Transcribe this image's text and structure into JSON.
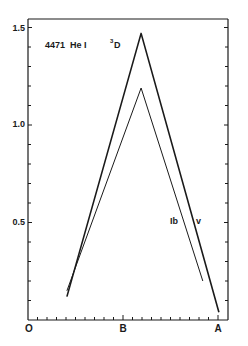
{
  "chart_data": {
    "type": "line",
    "title": "4471 He I",
    "subtitle": "3D",
    "xlabel": "",
    "ylabel": "",
    "x_tick_labels": [
      {
        "label": "O",
        "value": 0
      },
      {
        "label": "B",
        "value": 1
      },
      {
        "label": "A",
        "value": 2
      }
    ],
    "y_tick_labels": [
      "0.5",
      "1.0",
      "1.5"
    ],
    "ylim": [
      0,
      1.55
    ],
    "xlim": [
      0,
      2.1
    ],
    "grid": false,
    "legend": "inline labels near line ends",
    "series": [
      {
        "name": "V",
        "label": "v",
        "style": "thick",
        "points": [
          [
            0.41,
            0.12
          ],
          [
            1.19,
            1.47
          ],
          [
            2.01,
            0.04
          ]
        ]
      },
      {
        "name": "Ib",
        "label": "Ib",
        "style": "thin",
        "points": [
          [
            0.41,
            0.15
          ],
          [
            1.19,
            1.19
          ],
          [
            1.84,
            0.2
          ]
        ]
      }
    ]
  },
  "labels": {
    "title_line": "4471  He I",
    "term_sup": "3",
    "term": "D",
    "series_v": "v",
    "series_ib": "Ib",
    "y_15": "1.5",
    "y_10": "1.0",
    "y_05": "0.5",
    "x_o": "O",
    "x_b": "B",
    "x_a": "A"
  },
  "colors": {
    "ink": "#1a1a1a",
    "background": "#ffffff"
  }
}
